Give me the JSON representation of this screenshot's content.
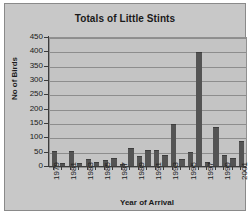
{
  "chart_data": {
    "type": "bar",
    "title": "Totals of Little Stints",
    "xlabel": "Year of Arrival",
    "ylabel": "No of Birds",
    "ylim": [
      0,
      450
    ],
    "ytick_step": 50,
    "yticks": [
      450,
      400,
      350,
      300,
      250,
      200,
      150,
      100,
      50,
      0
    ],
    "grid": true,
    "legend": "none",
    "bar_color": "#545454",
    "plot_background": "#c4c4c4",
    "figure_background": "#c8c8c8",
    "gridline_color": "#8d8d8d",
    "axis_color": "#3c3c3c",
    "categories": [
      "1979",
      "1980",
      "1981",
      "1982",
      "1983",
      "1984",
      "1985",
      "1986",
      "1987",
      "1988",
      "1989",
      "1990",
      "1991",
      "1992",
      "1993",
      "1994",
      "1995",
      "1996",
      "1997",
      "1998",
      "1999",
      "2000",
      "2001"
    ],
    "tick_labels": [
      "1979",
      "",
      "1981",
      "",
      "1983",
      "",
      "1985",
      "",
      "1987",
      "",
      "1989",
      "",
      "1991",
      "",
      "1993",
      "",
      "1995",
      "",
      "1997",
      "",
      "1999",
      "",
      "2001"
    ],
    "values": [
      57,
      14,
      55,
      13,
      28,
      18,
      23,
      32,
      12,
      66,
      38,
      60,
      59,
      41,
      151,
      27,
      51,
      400,
      16,
      138,
      43,
      30,
      90
    ]
  }
}
